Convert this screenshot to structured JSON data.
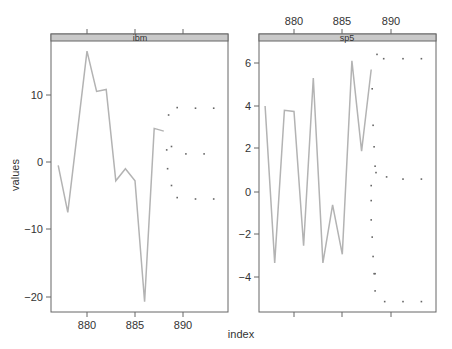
{
  "chart_data": {
    "type": "line",
    "title": "",
    "xlabel": "index",
    "ylabel": "values",
    "layout": "two lattice panels side by side; shared x-axis; forecast dots beyond observed series",
    "panels": [
      {
        "name": "ibm",
        "strip_label": "ibm",
        "xlim": [
          876.5,
          894.5
        ],
        "ylim": [
          -23,
          21
        ],
        "x_ticks": [
          880,
          885,
          890
        ],
        "y_ticks": [
          -20,
          -10,
          0,
          10
        ],
        "x_tick_side": "bottom",
        "series": [
          {
            "name": "observed",
            "style": "line",
            "color": "#b3b3b3",
            "x": [
              877,
              878,
              879,
              880,
              881,
              882,
              883,
              884,
              885,
              886,
              887,
              888
            ],
            "y": [
              -0.5,
              -7.5,
              4.5,
              16.5,
              10.5,
              10.8,
              -2.8,
              -1.0,
              -2.8,
              -20.8,
              5.0,
              4.6
            ]
          },
          {
            "name": "forecast_upper_outer",
            "style": "points",
            "x": [
              888.5,
              889.4,
              891.3,
              893.2
            ],
            "y": [
              7.0,
              8.1,
              8.0,
              8.0
            ]
          },
          {
            "name": "forecast_mean",
            "style": "points",
            "x": [
              888.3,
              888.8,
              890.3,
              892.2
            ],
            "y": [
              1.8,
              2.3,
              1.2,
              1.2
            ]
          },
          {
            "name": "forecast_lower_outer",
            "style": "points",
            "x": [
              888.4,
              888.8,
              889.4,
              891.3,
              893.2
            ],
            "y": [
              -1.0,
              -3.5,
              -5.3,
              -5.5,
              -5.5
            ]
          }
        ]
      },
      {
        "name": "sp5",
        "strip_label": "sp5",
        "xlim": [
          876.5,
          894.5
        ],
        "ylim": [
          -5.5,
          7.2
        ],
        "x_ticks": [
          880,
          885,
          890
        ],
        "y_ticks": [
          -4,
          -2,
          0,
          2,
          4,
          6
        ],
        "x_tick_side": "top",
        "series": [
          {
            "name": "observed",
            "style": "line",
            "color": "#b3b3b3",
            "x": [
              877,
              878,
              879,
              880,
              881,
              882,
              883,
              884,
              885,
              886,
              887,
              888
            ],
            "y": [
              4.0,
              -3.3,
              3.8,
              3.75,
              -2.5,
              5.3,
              -3.3,
              -0.6,
              -2.9,
              6.1,
              1.9,
              5.7
            ]
          },
          {
            "name": "forecast_upper",
            "style": "points",
            "x": [
              888.1,
              888.2,
              888.3,
              888.4,
              888.6,
              889.3,
              891.3,
              893.2
            ],
            "y": [
              4.8,
              3.1,
              2.1,
              1.2,
              6.4,
              6.2,
              6.2,
              6.2
            ]
          },
          {
            "name": "forecast_mean",
            "style": "points",
            "x": [
              888.0,
              888.5,
              889.6,
              891.3,
              893.2
            ],
            "y": [
              0.3,
              0.9,
              0.7,
              0.6,
              0.6
            ]
          },
          {
            "name": "forecast_lower",
            "style": "points",
            "x": [
              888.0,
              888.0,
              888.1,
              888.2,
              888.3,
              888.4,
              888.4,
              889.4,
              891.3,
              893.2
            ],
            "y": [
              -0.4,
              -1.3,
              -2.1,
              -3.0,
              -3.8,
              -4.6,
              -3.8,
              -5.1,
              -5.1,
              -5.1
            ]
          }
        ]
      }
    ]
  },
  "labels": {
    "xlabel": "index",
    "ylabel": "values",
    "panel_left_strip": "ibm",
    "panel_right_strip": "sp5",
    "left_y_ticks": [
      "10",
      "0",
      "−10",
      "−20"
    ],
    "right_y_ticks": [
      "6",
      "4",
      "2",
      "0",
      "−2",
      "−4"
    ],
    "left_x_ticks": [
      "880",
      "885",
      "890"
    ],
    "right_x_ticks": [
      "880",
      "885",
      "890"
    ]
  },
  "colors": {
    "line": "#b3b3b3",
    "strip_bg": "#c9c9c9",
    "axis": "#555555",
    "points": "#666666"
  }
}
